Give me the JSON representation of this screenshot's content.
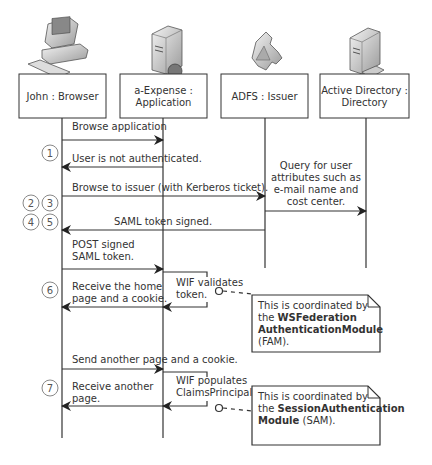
{
  "participants": [
    {
      "id": "browser",
      "label_lines": [
        "John : Browser"
      ],
      "icon": "desktop-computer-icon",
      "x": 62,
      "box": [
        19,
        74,
        87,
        44
      ]
    },
    {
      "id": "app",
      "label_lines": [
        "a-Expense :",
        "Application"
      ],
      "icon": "web-server-icon",
      "x": 163,
      "box": [
        120,
        74,
        87,
        44
      ]
    },
    {
      "id": "issuer",
      "label_lines": [
        "ADFS : Issuer"
      ],
      "icon": "issuer-puzzle-icon",
      "x": 265,
      "box": [
        221,
        74,
        87,
        44
      ]
    },
    {
      "id": "directory",
      "label_lines": [
        "Active Directory :",
        "Directory"
      ],
      "icon": "directory-server-icon",
      "x": 366,
      "box": [
        320,
        74,
        89,
        44
      ]
    }
  ],
  "lifelines": [
    {
      "x": 62,
      "y1": 118,
      "y2": 438
    },
    {
      "x": 163,
      "y1": 118,
      "y2": 438
    },
    {
      "x": 265,
      "y1": 118,
      "y2": 268
    },
    {
      "x": 366,
      "y1": 118,
      "y2": 268
    }
  ],
  "messages": [
    {
      "from": 62,
      "to": 163,
      "y": 140,
      "label_lines": [
        "Browse application"
      ],
      "label_x": 72,
      "label_y": 130
    },
    {
      "from": 163,
      "to": 62,
      "y": 167,
      "label_lines": [
        "User is not authenticated."
      ],
      "label_x": 72,
      "label_y": 162
    },
    {
      "from": 62,
      "to": 265,
      "y": 196,
      "label_lines": [
        "Browse to issuer (with Kerberos ticket)."
      ],
      "label_x": 72,
      "label_y": 191
    },
    {
      "from": 265,
      "to": 366,
      "y": 211,
      "label_lines": [
        "Query for user",
        "attributes such as",
        "e-mail name and",
        "cost center."
      ],
      "label_x": 316,
      "label_y": 169,
      "anchor": "middle"
    },
    {
      "from": 265,
      "to": 62,
      "y": 230,
      "label_lines": [
        "SAML token signed."
      ],
      "label_x": 163,
      "label_y": 225,
      "anchor": "middle"
    },
    {
      "from": 62,
      "to": 163,
      "y": 269,
      "label_lines": [
        "POST signed",
        "SAML token."
      ],
      "label_x": 72,
      "label_y": 248
    },
    {
      "from": 163,
      "to": 62,
      "y": 307,
      "label_lines": [
        "Receive the home",
        "page and a cookie."
      ],
      "label_x": 72,
      "label_y": 290
    },
    {
      "from": 62,
      "to": 163,
      "y": 369,
      "label_lines": [
        "Send another page and a cookie."
      ],
      "label_x": 72,
      "label_y": 363
    },
    {
      "from": 163,
      "to": 62,
      "y": 406,
      "label_lines": [
        "Receive another",
        "page."
      ],
      "label_x": 72,
      "label_y": 390
    }
  ],
  "self_calls": [
    {
      "x": 163,
      "right": 207,
      "y1": 272,
      "y2": 307,
      "label_lines": [
        "WIF validates",
        "token."
      ],
      "label_x": 176,
      "label_y": 286
    },
    {
      "x": 163,
      "right": 207,
      "y1": 372,
      "y2": 406,
      "label_lines": [
        "WIF populates",
        "ClaimsPrincipal."
      ],
      "label_x": 176,
      "label_y": 384
    }
  ],
  "step_markers": [
    {
      "labels": [
        "1"
      ],
      "y": 153
    },
    {
      "labels": [
        "2",
        "3"
      ],
      "y": 203
    },
    {
      "labels": [
        "4",
        "5"
      ],
      "y": 222
    },
    {
      "labels": [
        "6"
      ],
      "y": 290
    },
    {
      "labels": [
        "7"
      ],
      "y": 388
    }
  ],
  "notes": [
    {
      "box": [
        252,
        295,
        128,
        57
      ],
      "anchor_x": 219,
      "anchor_y": 291,
      "lines": [
        [
          {
            "t": "This is coordinated by",
            "b": false
          }
        ],
        [
          {
            "t": "the ",
            "b": false
          },
          {
            "t": "WSFederation",
            "b": true
          }
        ],
        [
          {
            "t": "AuthenticationModule",
            "b": true
          }
        ],
        [
          {
            "t": "(FAM).",
            "b": false
          }
        ]
      ]
    },
    {
      "box": [
        252,
        386,
        128,
        59
      ],
      "anchor_x": 219,
      "anchor_y": 408,
      "lines": [
        [
          {
            "t": "This is coordinated by",
            "b": false
          }
        ],
        [
          {
            "t": "the ",
            "b": false
          },
          {
            "t": "SessionAuthentication",
            "b": true
          }
        ],
        [
          {
            "t": "Module",
            "b": true
          },
          {
            "t": " (SAM).",
            "b": false
          }
        ]
      ]
    }
  ],
  "colors": {
    "line": "#333333",
    "text": "#333333",
    "circle": "#888888",
    "note_border": "#333333"
  }
}
